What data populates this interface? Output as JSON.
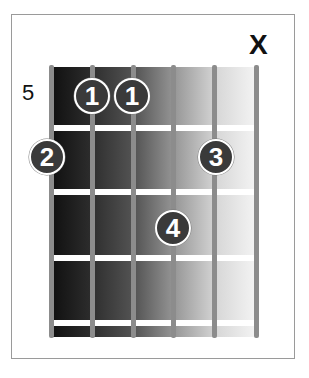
{
  "diagram": {
    "type": "guitar-chord-chart",
    "starting_fret_label": "5",
    "muted_string_marker": "X",
    "strings": 6,
    "frets_shown": 4,
    "fingers": [
      {
        "label": "1",
        "string": 5,
        "fret": 1
      },
      {
        "label": "1",
        "string": 4,
        "fret": 1
      },
      {
        "label": "2",
        "string": 6,
        "fret": 2
      },
      {
        "label": "3",
        "string": 2,
        "fret": 2
      },
      {
        "label": "4",
        "string": 3,
        "fret": 3
      }
    ],
    "muted_string": 1
  },
  "colors": {
    "board_dark": "#111111",
    "board_light": "#f6f6f6",
    "string": "#8c8c8c",
    "fret": "#ffffff",
    "dot_fill": "#3a3a3a",
    "dot_outline": "#ffffff"
  }
}
